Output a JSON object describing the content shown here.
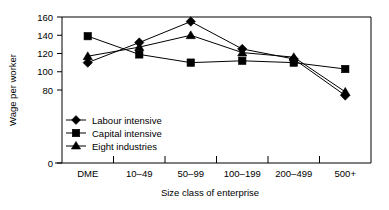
{
  "chart_data": {
    "type": "line",
    "title": "",
    "xlabel": "Size class of enterprise",
    "ylabel": "Wage per worker",
    "categories": [
      "DME",
      "10–49",
      "50–99",
      "100–199",
      "200–499",
      "500+"
    ],
    "ylim": [
      0,
      160
    ],
    "yticks": [
      0,
      80,
      100,
      120,
      140,
      160
    ],
    "ytick_labels": [
      "0",
      "80",
      "100",
      "120",
      "140",
      "160"
    ],
    "grid": false,
    "legend_position": "inside-lower-left",
    "series": [
      {
        "name": "Labour intensive",
        "marker": "diamond",
        "values": [
          110,
          132,
          155,
          125,
          114,
          74
        ]
      },
      {
        "name": "Capital intensive",
        "marker": "square",
        "values": [
          139,
          119,
          110,
          112,
          110,
          103
        ]
      },
      {
        "name": "Eight industries",
        "marker": "triangle",
        "values": [
          117,
          127,
          140,
          121,
          116,
          78
        ]
      }
    ]
  },
  "axes": {
    "y_title": "Wage per worker",
    "x_title": "Size class of enterprise",
    "y_tick_0": "0",
    "y_tick_80": "80",
    "y_tick_100": "100",
    "y_tick_120": "120",
    "y_tick_140": "140",
    "y_tick_160": "160",
    "x_cat_0": "DME",
    "x_cat_1": "10–49",
    "x_cat_2": "50–99",
    "x_cat_3": "100–199",
    "x_cat_4": "200–499",
    "x_cat_5": "500+"
  },
  "legend": {
    "item_0": "Labour intensive",
    "item_1": "Capital intensive",
    "item_2": "Eight industries"
  },
  "colors": {
    "ink": "#000000",
    "background": "#ffffff"
  }
}
